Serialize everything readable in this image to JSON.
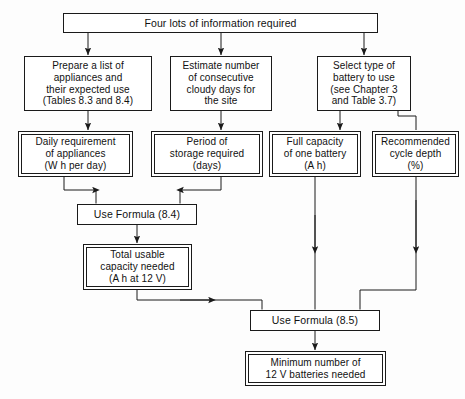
{
  "diagram": {
    "title": "Four lots of information required",
    "nodes": {
      "header": {
        "label": "Four lots of information required"
      },
      "prepare_list": {
        "lines": [
          "Prepare a list of",
          "appliances and",
          "their expected use",
          "(Tables 8.3 and 8.4)"
        ]
      },
      "estimate_cloudy": {
        "lines": [
          "Estimate number",
          "of consecutive",
          "cloudy days for",
          "the site"
        ]
      },
      "select_battery": {
        "lines": [
          "Select type of",
          "battery to use",
          "(see Chapter 3",
          "and Table 3.7)"
        ]
      },
      "daily_requirement": {
        "lines": [
          "Daily requirement",
          "of appliances",
          "(W h per day)"
        ]
      },
      "storage_period": {
        "lines": [
          "Period of",
          "storage required",
          "(days)"
        ]
      },
      "full_capacity": {
        "lines": [
          "Full capacity",
          "of one battery",
          "(A h)"
        ]
      },
      "cycle_depth": {
        "lines": [
          "Recommended",
          "cycle depth",
          "(%)"
        ]
      },
      "formula_84": {
        "label": "Use Formula (8.4)"
      },
      "total_usable": {
        "lines": [
          "Total usable",
          "capacity needed",
          "(A h at 12 V)"
        ]
      },
      "formula_85": {
        "label": "Use Formula (8.5)"
      },
      "result": {
        "lines": [
          "Minimum number of",
          "12 V batteries needed"
        ]
      }
    },
    "colors": {
      "stroke": "#1a1a1a",
      "fill": "#ffffff",
      "background": "#fdfdfd",
      "text": "#111111"
    }
  }
}
